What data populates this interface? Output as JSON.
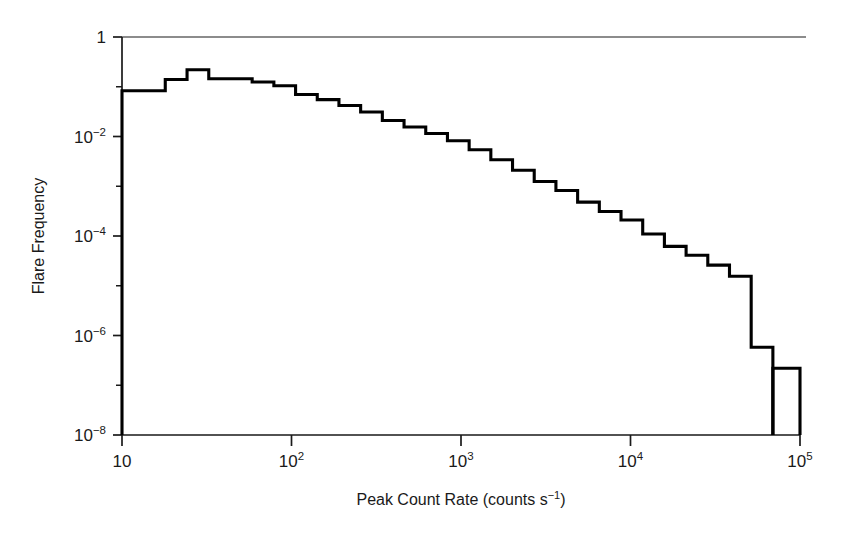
{
  "figure": {
    "background": "#ffffff",
    "line_color": "#000000",
    "axis_color": "#1a1a1a"
  },
  "chart_data": {
    "type": "line",
    "subtype": "step-histogram",
    "title": "",
    "xlabel": "Peak Count Rate (counts s−1)",
    "xlabel_parts": {
      "text": "Peak Count Rate (counts s",
      "exp": "−1",
      "tail": ")"
    },
    "ylabel": "Flare Frequency",
    "xscale": "log",
    "yscale": "log",
    "xlim": [
      10,
      100000
    ],
    "ylim": [
      1e-08,
      1
    ],
    "grid": false,
    "legend": null,
    "xticks": [
      10,
      100,
      1000,
      10000,
      100000
    ],
    "xtick_labels": [
      "10",
      "10²",
      "10³",
      "10⁴",
      "10⁵"
    ],
    "xtick_label_parts": [
      {
        "base": "10",
        "exp": ""
      },
      {
        "base": "10",
        "exp": "2"
      },
      {
        "base": "10",
        "exp": "3"
      },
      {
        "base": "10",
        "exp": "4"
      },
      {
        "base": "10",
        "exp": "5"
      }
    ],
    "yticks": [
      1,
      0.01,
      0.0001,
      1e-06,
      1e-08
    ],
    "ytick_labels": [
      "1",
      "10−2",
      "10−4",
      "10−6",
      "10−8"
    ],
    "ytick_label_parts": [
      {
        "base": "1",
        "exp": ""
      },
      {
        "base": "10",
        "exp": "−2"
      },
      {
        "base": "10",
        "exp": "−4"
      },
      {
        "base": "10",
        "exp": "−6"
      },
      {
        "base": "10",
        "exp": "−8"
      }
    ],
    "yminor_ticks": [
      0.1,
      0.001,
      1e-05,
      1e-07
    ],
    "bin_edges": [
      10.0,
      13.4,
      18.0,
      24.2,
      32.5,
      43.6,
      58.6,
      78.7,
      105.7,
      141.9,
      190.5,
      255.8,
      343.5,
      461.3,
      619.4,
      831.8,
      1116.9,
      1499.7,
      2013.8,
      2704.0,
      3631.0,
      4876.0,
      6547.0,
      8791.0,
      11804.0,
      15851.0,
      21283.0,
      28576.0,
      38370.0,
      51523.0,
      69183.0,
      92897.0
    ],
    "bin_values": [
      0.083,
      0.083,
      0.14,
      0.22,
      0.145,
      0.145,
      0.125,
      0.105,
      0.07,
      0.055,
      0.042,
      0.031,
      0.021,
      0.0155,
      0.0115,
      0.0082,
      0.0054,
      0.0034,
      0.0021,
      0.00125,
      0.00082,
      0.00048,
      0.00031,
      0.00021,
      0.00011,
      6.2e-05,
      4.1e-05,
      2.6e-05,
      1.55e-05,
      5.8e-07,
      0.0
    ],
    "isolated_bin": {
      "x_start": 69183.0,
      "x_end": 100000.0,
      "value": 2.2e-07,
      "note": "separate narrow bin near 10⁵ rising from baseline"
    },
    "peak": {
      "x": 24.2,
      "y": 0.22
    }
  }
}
